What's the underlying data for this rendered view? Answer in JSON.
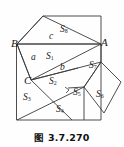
{
  "figure": {
    "caption": "图 3.7.270",
    "stroke_color": "#3a3a3a",
    "text_color": "#1a1a1a",
    "background_color": "#fefefe",
    "vertices": [
      {
        "name": "B",
        "label": "B",
        "x": 17,
        "y": 45
      },
      {
        "name": "A",
        "label": "A",
        "x": 101,
        "y": 44
      },
      {
        "name": "C",
        "label": "C",
        "x": 31,
        "y": 82
      }
    ],
    "side_labels": [
      {
        "name": "c",
        "label": "c",
        "x": 51,
        "y": 37
      },
      {
        "name": "a",
        "label": "a",
        "x": 33,
        "y": 58
      },
      {
        "name": "b",
        "label": "b",
        "x": 62,
        "y": 68
      }
    ],
    "regions": [
      {
        "name": "S1",
        "base": "S",
        "sub": "1",
        "x": 50,
        "y": 57
      },
      {
        "name": "S2",
        "base": "S",
        "sub": "2",
        "x": 53,
        "y": 82
      },
      {
        "name": "S3",
        "base": "S",
        "sub": "3",
        "x": 27,
        "y": 98
      },
      {
        "name": "S4",
        "base": "S",
        "sub": "4",
        "x": 60,
        "y": 110
      },
      {
        "name": "S5",
        "base": "S",
        "sub": "5",
        "x": 76,
        "y": 93
      },
      {
        "name": "S6",
        "base": "S",
        "sub": "6",
        "x": 99,
        "y": 95
      },
      {
        "name": "S7",
        "base": "S",
        "sub": "7",
        "x": 91,
        "y": 66
      },
      {
        "name": "S8",
        "base": "S",
        "sub": "8",
        "x": 63,
        "y": 30
      }
    ],
    "markers": [
      {
        "name": "right-angle-mark",
        "x": 67,
        "y": 90
      }
    ]
  }
}
